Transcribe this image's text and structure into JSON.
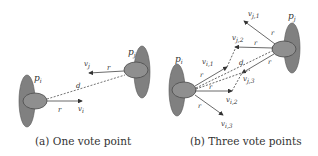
{
  "figure": {
    "colors": {
      "ellipse_outer": "#808080",
      "ellipse_inner": "#8f8f8f",
      "ellipse_stroke": "#4a4a4a",
      "arrow": "#444444"
    },
    "panel_a": {
      "caption": "(a) One vote point",
      "labels": {
        "pi": "p",
        "pi_sub": "i",
        "pj": "p",
        "pj_sub": "j",
        "d": "d",
        "r1": "r",
        "r2": "r",
        "vi": "v",
        "vi_sub": "i",
        "vj": "v",
        "vj_sub": "j"
      }
    },
    "panel_b": {
      "caption": "(b) Three vote points",
      "labels": {
        "pi": "p",
        "pi_sub": "i",
        "pj": "p",
        "pj_sub": "j",
        "d": "d",
        "r": "r",
        "vj1": "v",
        "vj1_sub": "j,1",
        "vj2": "v",
        "vj2_sub": "j,2",
        "vj3": "v",
        "vj3_sub": "j,3",
        "vi1": "v",
        "vi1_sub": "i,1",
        "vi2": "v",
        "vi2_sub": "i,2",
        "vi3": "v",
        "vi3_sub": "i,3"
      }
    }
  }
}
